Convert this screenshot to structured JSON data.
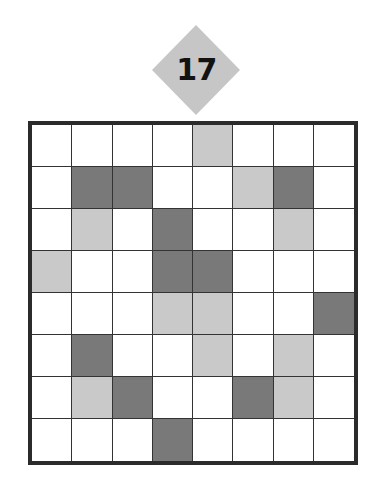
{
  "badge": {
    "label": "17",
    "shape": "diamond",
    "fill_color": "#c6c6c6",
    "text_color": "#121212"
  },
  "grid": {
    "rows": 8,
    "columns": 8,
    "border_color": "#2b2b2b",
    "gridline_color": "#333333",
    "palette": {
      "white": "#ffffff",
      "light": "#c9c9c9",
      "dark": "#797979"
    },
    "legend": {
      "white": "empty",
      "light": "light-gray-filled",
      "dark": "dark-gray-filled"
    },
    "cells": [
      [
        "white",
        "white",
        "white",
        "white",
        "light",
        "white",
        "white",
        "white"
      ],
      [
        "white",
        "dark",
        "dark",
        "white",
        "white",
        "light",
        "dark",
        "white"
      ],
      [
        "white",
        "light",
        "white",
        "dark",
        "white",
        "white",
        "light",
        "white"
      ],
      [
        "light",
        "white",
        "white",
        "dark",
        "dark",
        "white",
        "white",
        "white"
      ],
      [
        "white",
        "white",
        "white",
        "light",
        "light",
        "white",
        "white",
        "dark"
      ],
      [
        "white",
        "dark",
        "white",
        "white",
        "light",
        "white",
        "light",
        "white"
      ],
      [
        "white",
        "light",
        "dark",
        "white",
        "white",
        "dark",
        "light",
        "white"
      ],
      [
        "white",
        "white",
        "white",
        "dark",
        "white",
        "white",
        "white",
        "white"
      ]
    ]
  }
}
